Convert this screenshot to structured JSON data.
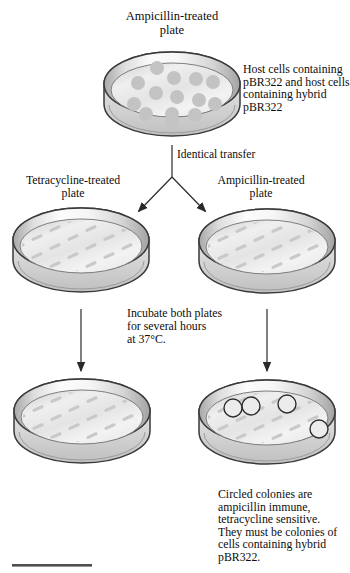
{
  "diagram": {
    "top": {
      "plate_label": "Ampicillin-treated\nplate",
      "annotation": "Host cells containing\npBR322 and host cells\ncontaining hybrid\npBR322"
    },
    "transfer_label": "Identical transfer",
    "middle": {
      "left_plate_label": "Tetracycline-treated\nplate",
      "right_plate_label": "Ampicillin-treated\nplate",
      "incubation_note": "Incubate both plates\nfor several hours\nat 37°C."
    },
    "bottom": {
      "result_annotation": "Circled colonies are\nampicillin immune,\ntetracycline sensitive.\nThey must be colonies of\ncells containing hybrid\npBR322."
    },
    "colors": {
      "plate_outline": "#3a3a3a",
      "colony": "#c3c3c3",
      "streak": "#c9c9c9",
      "circled_colony_outline": "#2f2f2f",
      "arrow": "#2a2a2a",
      "rule": "#4f4f4f"
    }
  }
}
